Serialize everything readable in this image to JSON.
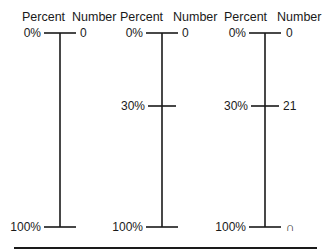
{
  "headers": {
    "percent": "Percent",
    "number": "Number"
  },
  "panels": [
    {
      "ticks": [
        {
          "pos": 0,
          "percent_label": "0%",
          "number_label": "0"
        },
        {
          "pos": 100,
          "percent_label": "100%",
          "number_label": ""
        }
      ]
    },
    {
      "ticks": [
        {
          "pos": 0,
          "percent_label": "0%",
          "number_label": "0"
        },
        {
          "pos": 30,
          "percent_label": "30%",
          "number_label": ""
        },
        {
          "pos": 100,
          "percent_label": "100%",
          "number_label": ""
        }
      ]
    },
    {
      "ticks": [
        {
          "pos": 0,
          "percent_label": "0%",
          "number_label": "0"
        },
        {
          "pos": 30,
          "percent_label": "30%",
          "number_label": "21"
        },
        {
          "pos": 100,
          "percent_label": "100%",
          "number_label": "n"
        }
      ]
    }
  ],
  "p0": {
    "percent_header": "Percent",
    "number_header": "Number",
    "t0": {
      "pct": "0%",
      "num": "0"
    },
    "t2": {
      "pct": "100%",
      "num": ""
    }
  },
  "p1": {
    "percent_header": "Percent",
    "number_header": "Number",
    "t0": {
      "pct": "0%",
      "num": "0"
    },
    "t1": {
      "pct": "30%",
      "num": ""
    },
    "t2": {
      "pct": "100%",
      "num": ""
    }
  },
  "p2": {
    "percent_header": "Percent",
    "number_header": "Number",
    "t0": {
      "pct": "0%",
      "num": "0"
    },
    "t1": {
      "pct": "30%",
      "num": "21"
    },
    "t2": {
      "pct": "100%",
      "num": "∩"
    }
  },
  "colors": {
    "ink": "#1a1a1a",
    "background": "#ffffff"
  }
}
